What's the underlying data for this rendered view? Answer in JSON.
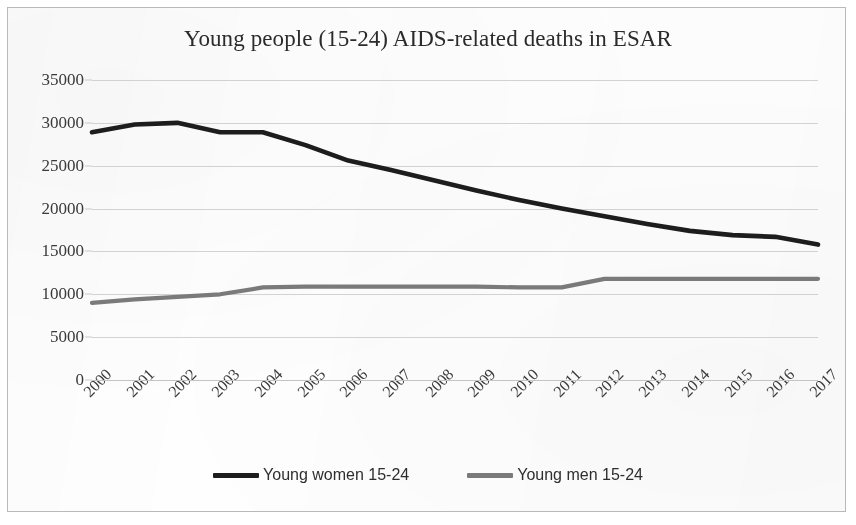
{
  "chart_data": {
    "type": "line",
    "title": "Young people (15-24) AIDS-related deaths in ESAR",
    "xlabel": "",
    "ylabel": "",
    "categories": [
      "2000",
      "2001",
      "2002",
      "2003",
      "2004",
      "2005",
      "2006",
      "2007",
      "2008",
      "2009",
      "2010",
      "2011",
      "2012",
      "2013",
      "2014",
      "2015",
      "2016",
      "2017"
    ],
    "ylim": [
      0,
      35000
    ],
    "y_ticks": [
      0,
      5000,
      10000,
      15000,
      20000,
      25000,
      30000,
      35000
    ],
    "y_tick_labels": [
      "0",
      "5000",
      "10000",
      "15000",
      "20000",
      "25000",
      "30000",
      "35000"
    ],
    "grid": true,
    "legend_position": "bottom",
    "series": [
      {
        "name": "Young women 15-24",
        "color": "#1d1d1d",
        "values": [
          28900,
          29800,
          30000,
          28900,
          28900,
          27400,
          25600,
          24500,
          23300,
          22100,
          21000,
          20000,
          19100,
          18200,
          17400,
          16900,
          16700,
          15800
        ]
      },
      {
        "name": "Young men 15-24",
        "color": "#7a7a7a",
        "values": [
          9000,
          9400,
          9700,
          10000,
          10800,
          10900,
          10900,
          10900,
          10900,
          10900,
          10800,
          10800,
          11800,
          11800,
          11800,
          11800,
          11800,
          11800
        ]
      }
    ]
  },
  "colors": {
    "women_line": "#1d1d1d",
    "men_line": "#7a7a7a",
    "gridline": "#d2d2d2",
    "text": "#2e2e2e",
    "frame": "#b9b9b9",
    "background": "#fefefe"
  }
}
